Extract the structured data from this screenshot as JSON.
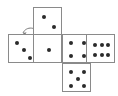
{
  "diagram": {
    "type": "cube-net",
    "colors": {
      "background": "#ffffff",
      "face_fill": "#ffffff",
      "face_stroke": "#8a8a8a",
      "pip": "#2b2b2b",
      "arrow": "#7a7a7a"
    },
    "face_size": 29,
    "faces": [
      {
        "name": "top-face",
        "value": 2,
        "x": 33,
        "y": 7,
        "pattern": "diagonal-two",
        "pips": [
          [
            0.34,
            0.3
          ],
          [
            0.69,
            0.66
          ]
        ]
      },
      {
        "name": "left-face",
        "value": 3,
        "x": 8,
        "y": 34,
        "pattern": "diagonal-three",
        "pips": [
          [
            0.26,
            0.26
          ],
          [
            0.5,
            0.52
          ],
          [
            0.74,
            0.78
          ]
        ]
      },
      {
        "name": "front-face",
        "value": 1,
        "x": 33,
        "y": 34,
        "pattern": "center-one",
        "pips": [
          [
            0.5,
            0.5
          ]
        ]
      },
      {
        "name": "right-face",
        "value": 4,
        "x": 62,
        "y": 34,
        "pattern": "four-corners",
        "pips": [
          [
            0.29,
            0.28
          ],
          [
            0.71,
            0.28
          ],
          [
            0.29,
            0.72
          ],
          [
            0.71,
            0.72
          ]
        ]
      },
      {
        "name": "back-face",
        "value": 6,
        "x": 86,
        "y": 34,
        "pattern": "six-two-rows",
        "pips": [
          [
            0.26,
            0.34
          ],
          [
            0.5,
            0.34
          ],
          [
            0.74,
            0.34
          ],
          [
            0.26,
            0.68
          ],
          [
            0.5,
            0.68
          ],
          [
            0.74,
            0.68
          ]
        ]
      },
      {
        "name": "bottom-face",
        "value": 5,
        "x": 62,
        "y": 63,
        "pattern": "quincunx-five",
        "pips": [
          [
            0.28,
            0.26
          ],
          [
            0.72,
            0.26
          ],
          [
            0.5,
            0.5
          ],
          [
            0.28,
            0.76
          ],
          [
            0.72,
            0.76
          ]
        ]
      }
    ],
    "arrow": {
      "name": "rotation-arrow",
      "path": "M 40 36 C 37 26 26 26 23 33",
      "head": "M 23 33 L 26.6 32.2 L 24.6 35.6 Z",
      "stroke_width": 1
    }
  }
}
